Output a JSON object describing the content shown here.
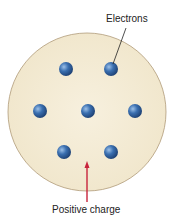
{
  "diagram": {
    "labels": {
      "electrons": "Electrons",
      "positive_charge": "Positive charge"
    },
    "colors": {
      "sphere_fill": "#f4ecd6",
      "sphere_stroke": "#b09a78",
      "electron": "#2e5f9e",
      "arrow": "#c8243c",
      "leader_line": "#222222"
    },
    "electrons": [
      {
        "x": 66,
        "y": 69
      },
      {
        "x": 111,
        "y": 69
      },
      {
        "x": 40,
        "y": 111
      },
      {
        "x": 88,
        "y": 111
      },
      {
        "x": 135,
        "y": 111
      },
      {
        "x": 64,
        "y": 152
      },
      {
        "x": 111,
        "y": 152
      }
    ]
  }
}
